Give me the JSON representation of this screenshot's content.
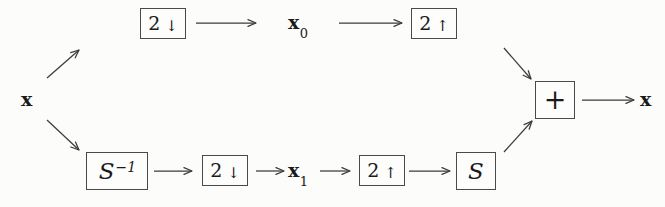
{
  "diagram": {
    "type": "signal-flow-block-diagram",
    "background_color": "#fcfcfb",
    "stroke_color": "#3b3b3b",
    "box_border_color": "#4a4a4a",
    "input_label": {
      "name": "input-signal",
      "base": "x",
      "sub": ""
    },
    "output_label": {
      "name": "output-signal",
      "base": "x",
      "sub": ""
    },
    "blocks": [
      {
        "id": "top-downsample",
        "kind": "rate-change",
        "num": "2",
        "dir": "↓",
        "full_text": "2 ↓",
        "branch": "top"
      },
      {
        "id": "top-upsample",
        "kind": "rate-change",
        "num": "2",
        "dir": "↑",
        "full_text": "2 ↑",
        "branch": "top"
      },
      {
        "id": "bottom-s-inverse",
        "kind": "matrix",
        "sym": "S",
        "sup": "−1",
        "full_text": "S⁻¹",
        "branch": "bottom"
      },
      {
        "id": "bottom-downsample",
        "kind": "rate-change",
        "num": "2",
        "dir": "↓",
        "full_text": "2 ↓",
        "branch": "bottom"
      },
      {
        "id": "bottom-upsample",
        "kind": "rate-change",
        "num": "2",
        "dir": "↑",
        "full_text": "2 ↑",
        "branch": "bottom"
      },
      {
        "id": "bottom-s",
        "kind": "matrix",
        "sym": "S",
        "sup": "",
        "full_text": "S",
        "branch": "bottom"
      },
      {
        "id": "summing-junction",
        "kind": "adder",
        "sym": "+",
        "full_text": "+",
        "branch": "merge"
      }
    ],
    "intermediate_labels": [
      {
        "id": "x0",
        "base": "x",
        "sub": "0",
        "full_text": "x₀",
        "branch": "top"
      },
      {
        "id": "x1",
        "base": "x",
        "sub": "1",
        "full_text": "x₁",
        "branch": "bottom"
      }
    ],
    "arrow_count": 12
  }
}
